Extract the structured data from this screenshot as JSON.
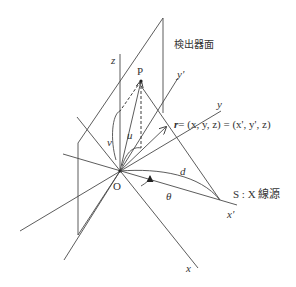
{
  "diagram": {
    "title": "",
    "labels": {
      "detector_plane": "検出器面",
      "z_axis": "z",
      "y_prime_axis": "y'",
      "y_axis": "y",
      "x_axis": "x",
      "x_prime_axis": "x'",
      "point_p": "P",
      "origin": "O",
      "u": "u",
      "v": "v",
      "d": "d",
      "theta": "θ",
      "r_vector": "r",
      "r_equation": "= (x, y, z) = (x', y', z)",
      "source": "S : X 線源"
    },
    "colors": {
      "line": "#4a4a4a",
      "text": "#333333",
      "background": "#ffffff"
    }
  }
}
